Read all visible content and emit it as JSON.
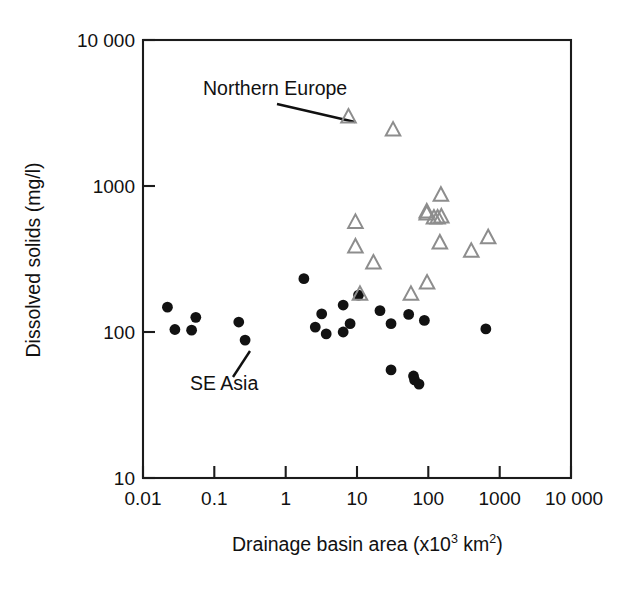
{
  "chart_data": {
    "type": "scatter",
    "title": "",
    "xlabel": "Drainage basin area (x10³ km²)",
    "xlabel_base": "Drainage basin area (x10",
    "xlabel_sup1": "3",
    "xlabel_mid": " km",
    "xlabel_sup2": "2",
    "xlabel_end": ")",
    "ylabel": "Dissolved solids (mg/l)",
    "xscale": "log",
    "yscale": "log",
    "xlim": [
      0.01,
      10000
    ],
    "ylim": [
      10,
      10000
    ],
    "grid": false,
    "legend": "none",
    "xticks": [
      0.01,
      0.1,
      1,
      10,
      100,
      1000,
      10000
    ],
    "xtick_labels": [
      "0.01",
      "0.1",
      "1",
      "10",
      "100",
      "1000",
      "10 000"
    ],
    "yticks": [
      10,
      100,
      1000,
      10000
    ],
    "ytick_labels": [
      "10",
      "100",
      "1000",
      "10 000"
    ],
    "annotations": [
      {
        "text": "Northern Europe",
        "label_x": 0.06,
        "label_y": 4900,
        "target_x": 7.6,
        "target_y": 2950,
        "leader": true
      },
      {
        "text": "SE Asia",
        "label_x": 0.033,
        "label_y": 48,
        "target_x": 0.25,
        "target_y": 90,
        "leader": true
      }
    ],
    "series": [
      {
        "name": "SE Asia",
        "marker": "filled-circle",
        "color": "#121212",
        "points": [
          {
            "x": 0.022,
            "y": 148
          },
          {
            "x": 0.028,
            "y": 104
          },
          {
            "x": 0.055,
            "y": 126
          },
          {
            "x": 0.048,
            "y": 103
          },
          {
            "x": 0.22,
            "y": 117
          },
          {
            "x": 0.27,
            "y": 88
          },
          {
            "x": 1.8,
            "y": 232
          },
          {
            "x": 3.2,
            "y": 133
          },
          {
            "x": 6.4,
            "y": 153
          },
          {
            "x": 2.6,
            "y": 108
          },
          {
            "x": 3.7,
            "y": 97
          },
          {
            "x": 6.4,
            "y": 100
          },
          {
            "x": 8.0,
            "y": 114
          },
          {
            "x": 10.5,
            "y": 179
          },
          {
            "x": 21,
            "y": 140
          },
          {
            "x": 30,
            "y": 114
          },
          {
            "x": 53,
            "y": 132
          },
          {
            "x": 88,
            "y": 120
          },
          {
            "x": 30,
            "y": 55
          },
          {
            "x": 62,
            "y": 50
          },
          {
            "x": 64,
            "y": 47
          },
          {
            "x": 74,
            "y": 44
          },
          {
            "x": 640,
            "y": 105
          }
        ]
      },
      {
        "name": "Northern Europe",
        "marker": "open-triangle",
        "color": "#8d8d8d",
        "points": [
          {
            "x": 7.6,
            "y": 2950
          },
          {
            "x": 32,
            "y": 2400
          },
          {
            "x": 9.5,
            "y": 560
          },
          {
            "x": 9.5,
            "y": 380
          },
          {
            "x": 11,
            "y": 180
          },
          {
            "x": 17,
            "y": 295
          },
          {
            "x": 57,
            "y": 180
          },
          {
            "x": 95,
            "y": 660
          },
          {
            "x": 95,
            "y": 640
          },
          {
            "x": 120,
            "y": 600
          },
          {
            "x": 135,
            "y": 600
          },
          {
            "x": 152,
            "y": 610
          },
          {
            "x": 150,
            "y": 860
          },
          {
            "x": 145,
            "y": 405
          },
          {
            "x": 96,
            "y": 215
          },
          {
            "x": 400,
            "y": 355
          },
          {
            "x": 690,
            "y": 440
          }
        ]
      }
    ]
  }
}
